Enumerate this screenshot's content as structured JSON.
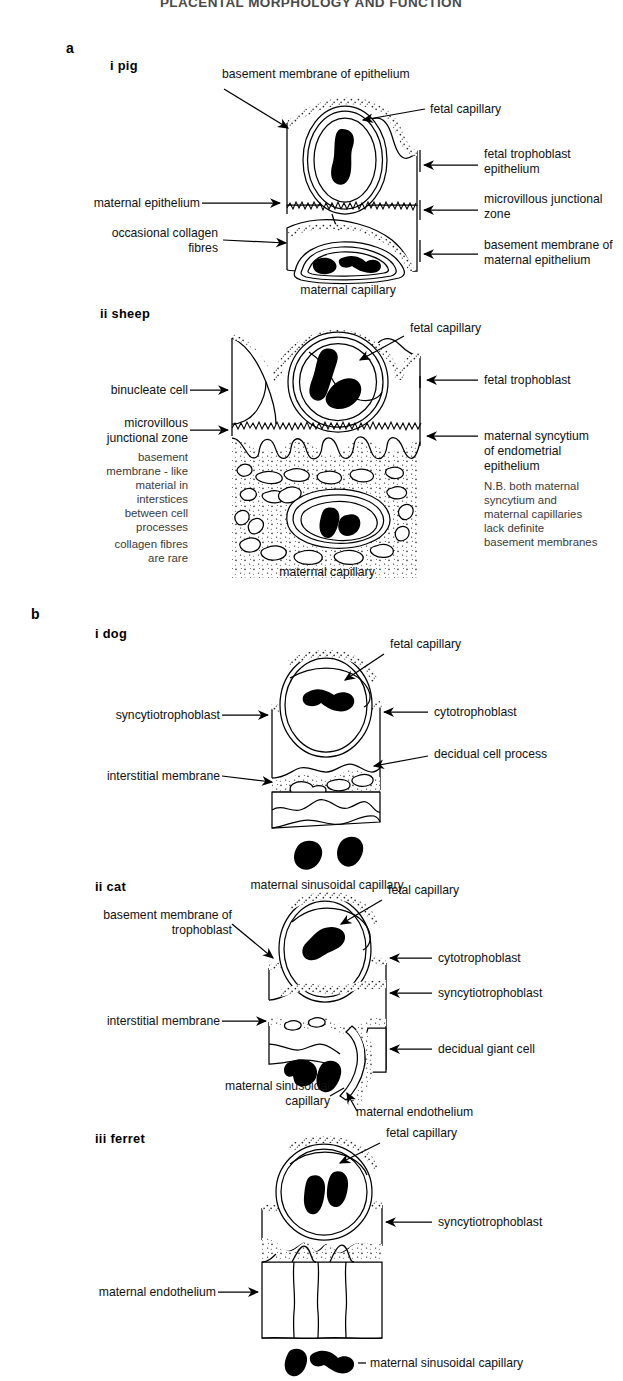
{
  "title": "PLACENTAL MORPHOLOGY AND FUNCTION",
  "sections": [
    {
      "key": "a",
      "label": "a",
      "panels": [
        {
          "key": "pig",
          "numeral": "i",
          "name": "pig",
          "heading": "i  pig",
          "labels": [
            "basement membrane of epithelium",
            "fetal capillary",
            "fetal trophoblast",
            "epithelium",
            "microvillous junctional",
            "zone",
            "maternal epithelium",
            "occasional collagen",
            "fibres",
            "basement membrane of",
            "maternal epithelium",
            "maternal capillary"
          ]
        },
        {
          "key": "sheep",
          "numeral": "ii",
          "name": "sheep",
          "heading": "ii  sheep",
          "labels": [
            "fetal capillary",
            "fetal trophoblast",
            "binucleate cell",
            "microvillous",
            "junctional zone",
            "maternal syncytium",
            "of endometrial",
            "epithelium",
            "maternal capillary"
          ],
          "note_left": [
            "basement",
            "membrane - like",
            "material in",
            "interstices",
            "between cell",
            "processes",
            "collagen fibres",
            "are rare"
          ],
          "note_right": [
            "N.B. both maternal",
            "syncytium and",
            "maternal capillaries",
            "lack definite",
            "basement membranes"
          ]
        }
      ]
    },
    {
      "key": "b",
      "label": "b",
      "panels": [
        {
          "key": "dog",
          "numeral": "i",
          "name": "dog",
          "heading": "i  dog",
          "labels": [
            "fetal capillary",
            "syncytiotrophoblast",
            "cytotrophoblast",
            "decidual cell process",
            "interstitial membrane",
            "maternal sinusoidal capillary"
          ]
        },
        {
          "key": "cat",
          "numeral": "ii",
          "name": "cat",
          "heading": "ii  cat",
          "labels": [
            "fetal capillary",
            "basement membrane of",
            "trophoblast",
            "cytotrophoblast",
            "syncytiotrophoblast",
            "interstitial membrane",
            "decidual giant cell",
            "maternal sinusoidal",
            "capillary",
            "maternal endothelium"
          ]
        },
        {
          "key": "ferret",
          "numeral": "iii",
          "name": "ferret",
          "heading": "iii  ferret",
          "labels": [
            "fetal capillary",
            "syncytiotrophoblast",
            "maternal endothelium",
            "maternal sinusoidal capillary"
          ]
        }
      ]
    }
  ],
  "colors": {
    "ink": "#000000",
    "paper": "#ffffff",
    "note_text": "#3a3a3a",
    "title_text": "#4a4a4a"
  }
}
